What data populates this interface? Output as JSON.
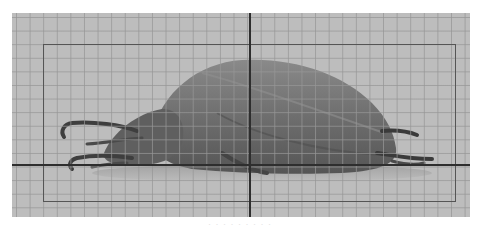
{
  "viewer": {
    "grid": {
      "visible": true,
      "cell_px": 13.6,
      "color": "#969696"
    },
    "background_color": "#bdbdbd",
    "roi_rectangle": {
      "color": "#555555"
    },
    "crosshair": {
      "x": 249,
      "y": 164,
      "color": "#2e2e2e"
    },
    "specimen": {
      "subject": "beetle",
      "body_color": "#6e6e6e"
    }
  },
  "caption": {
    "text": "· · ·  · · · · · ·"
  }
}
